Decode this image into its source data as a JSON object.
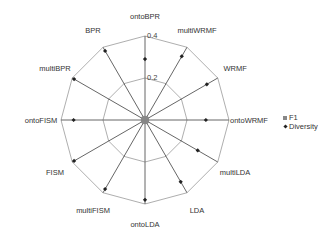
{
  "chart_data": {
    "type": "radar",
    "title": "",
    "categories": [
      "ontoBPR",
      "multiWRMF",
      "WRMF",
      "ontoWRMF",
      "multiLDA",
      "LDA",
      "ontoLDA",
      "multiFISM",
      "FISM",
      "ontoFISM",
      "multiBPR",
      "BPR"
    ],
    "series": [
      {
        "name": "F1",
        "marker": "square",
        "values": [
          0.01,
          0.01,
          0.01,
          0.01,
          0.01,
          0.01,
          0.01,
          0.01,
          0.01,
          0.01,
          0.01,
          0.01
        ]
      },
      {
        "name": "Diversity",
        "marker": "diamond",
        "values": [
          0.29,
          0.35,
          0.34,
          0.29,
          0.29,
          0.34,
          0.38,
          0.38,
          0.39,
          0.34,
          0.39,
          0.38
        ]
      }
    ],
    "rlim": [
      0,
      0.4
    ],
    "rticks": [
      0.2,
      0.4
    ],
    "rtick_labels": [
      "0.2",
      "0.4"
    ],
    "grid": true,
    "legend_position": "right"
  },
  "legend": {
    "items": [
      {
        "label": "F1"
      },
      {
        "label": "Diversity"
      }
    ]
  }
}
